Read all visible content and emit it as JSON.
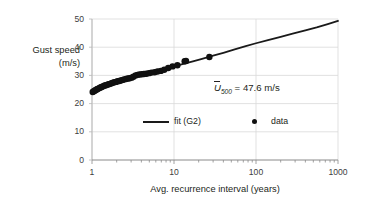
{
  "chart_data": {
    "type": "scatter",
    "title": "",
    "xlabel": "Avg. recurrence interval  (years)",
    "ylabel_line1": "Gust speed",
    "ylabel_line2": "(m/s)",
    "xscale": "log",
    "xlim": [
      1,
      1000
    ],
    "ylim": [
      0,
      50
    ],
    "xticks": [
      1,
      10,
      100,
      1000
    ],
    "xtick_labels": [
      "1",
      "10",
      "100",
      "1000"
    ],
    "yticks": [
      0,
      10,
      20,
      30,
      40,
      50
    ],
    "ytick_labels": [
      "0",
      "10",
      "20",
      "30",
      "40",
      "50"
    ],
    "grid": true,
    "grid_color": "#d9d9d9",
    "legend_position": "inside-lower-center",
    "legend": [
      {
        "label": "fit (G2)",
        "marker": "line",
        "color": "#1a1a1a"
      },
      {
        "label": "data",
        "marker": "dot",
        "color": "#101010"
      }
    ],
    "annotations": [
      {
        "text": "U̅500 = 47.6 m/s",
        "symbol": "U",
        "subscript": "500",
        "rest": " = 47.6 m/s",
        "value": 47.6,
        "units": "m/s",
        "x": 100,
        "y": 27
      }
    ],
    "series": [
      {
        "name": "fit (G2)",
        "type": "line",
        "color": "#1a1a1a",
        "linewidth": 1.8,
        "x": [
          1.0,
          1.2,
          1.5,
          2.0,
          2.5,
          3.0,
          4.0,
          5.0,
          6.5,
          8.0,
          10.0,
          13.0,
          17.0,
          22.0,
          30.0,
          40.0,
          55.0,
          75.0,
          100.0,
          140.0,
          200.0,
          280.0,
          400.0,
          550.0,
          750.0,
          1000.0
        ],
        "y": [
          24.2,
          25.2,
          26.2,
          27.4,
          28.3,
          29.0,
          30.0,
          30.8,
          31.7,
          32.4,
          33.2,
          34.1,
          35.0,
          35.9,
          37.0,
          38.0,
          39.2,
          40.4,
          41.4,
          42.5,
          43.7,
          44.8,
          46.0,
          47.0,
          48.2,
          49.3
        ]
      },
      {
        "name": "data",
        "type": "scatter",
        "color": "#101010",
        "markersize": 3.2,
        "x": [
          1.02,
          1.05,
          1.08,
          1.11,
          1.14,
          1.17,
          1.21,
          1.25,
          1.29,
          1.33,
          1.38,
          1.43,
          1.48,
          1.54,
          1.6,
          1.66,
          1.73,
          1.8,
          1.88,
          1.96,
          2.05,
          2.15,
          2.25,
          2.36,
          2.48,
          2.6,
          2.74,
          2.88,
          3.04,
          3.2,
          3.4,
          3.6,
          3.8,
          4.05,
          4.3,
          4.6,
          4.95,
          5.3,
          5.8,
          6.3,
          6.9,
          7.6,
          8.5,
          9.6,
          11.0,
          13.5,
          14.0,
          27.0
        ],
        "y": [
          24.1,
          24.4,
          24.6,
          24.8,
          25.0,
          25.2,
          25.4,
          25.6,
          25.8,
          26.0,
          26.2,
          26.4,
          26.5,
          26.7,
          26.9,
          27.0,
          27.2,
          27.4,
          27.6,
          27.7,
          27.9,
          28.0,
          28.2,
          28.4,
          28.6,
          28.7,
          28.9,
          29.0,
          29.2,
          29.5,
          30.0,
          30.2,
          30.3,
          30.4,
          30.5,
          30.6,
          30.8,
          31.0,
          31.1,
          31.4,
          31.6,
          32.0,
          32.6,
          33.2,
          33.6,
          35.0,
          35.1,
          36.5
        ]
      }
    ]
  },
  "plot_area": {
    "left": 92,
    "top": 19,
    "right": 338,
    "bottom": 160
  }
}
